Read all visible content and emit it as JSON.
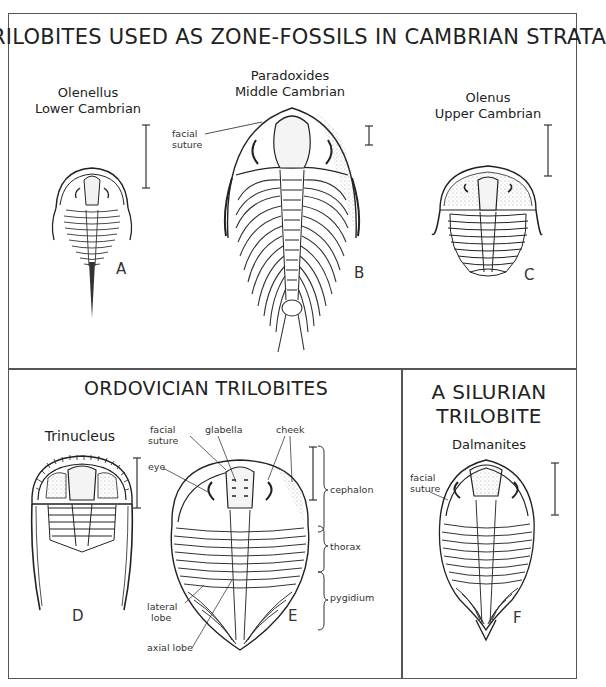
{
  "figure": {
    "top_panel": {
      "title": "TRILOBITES USED AS ZONE-FOSSILS IN CAMBRIAN STRATA",
      "specimens": [
        {
          "letter": "A",
          "genus": "Olenellus",
          "age": "Lower Cambrian"
        },
        {
          "letter": "B",
          "genus": "Paradoxides",
          "age": "Middle Cambrian",
          "labels": [
            "facial",
            "suture"
          ]
        },
        {
          "letter": "C",
          "genus": "Olenus",
          "age": "Upper Cambrian"
        }
      ]
    },
    "bottom_left_panel": {
      "title": "ORDOVICIAN TRILOBITES",
      "specimens": [
        {
          "letter": "D",
          "genus": "Trinucleus"
        },
        {
          "letter": "E",
          "labels": {
            "facial_suture_1": "facial",
            "facial_suture_2": "suture",
            "glabella": "glabella",
            "cheek": "cheek",
            "eye": "eye",
            "lateral_lobe_1": "lateral",
            "lateral_lobe_2": "lobe",
            "axial_lobe": "axial lobe",
            "cephalon": "cephalon",
            "thorax": "thorax",
            "pygidium": "pygidium"
          }
        }
      ]
    },
    "bottom_right_panel": {
      "title_line1": "A SILURIAN",
      "title_line2": "TRILOBITE",
      "specimens": [
        {
          "letter": "F",
          "genus": "Dalmanites",
          "labels": [
            "facial",
            "suture"
          ]
        }
      ]
    }
  },
  "colors": {
    "ink": "#222222",
    "frame": "#555555",
    "stipple": "#888888",
    "paper": "#ffffff"
  }
}
